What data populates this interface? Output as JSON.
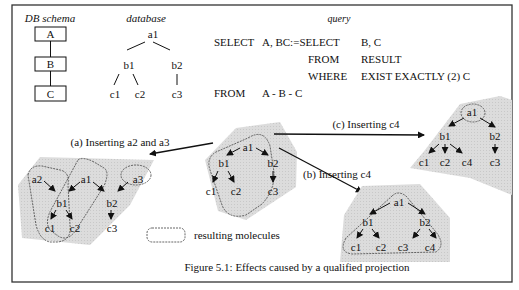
{
  "figure": {
    "caption": "Figure 5.1: Effects caused by a qualified projection",
    "colors": {
      "shade": "#d9d9d9",
      "ink": "#111111",
      "border": "#333333"
    }
  },
  "schema": {
    "title": "DB schema",
    "boxes": [
      "A",
      "B",
      "C"
    ]
  },
  "database": {
    "title": "database",
    "nodes": {
      "a1": "a1",
      "b1": "b1",
      "b2": "b2",
      "c1": "c1",
      "c2": "c2",
      "c3": "c3"
    }
  },
  "query": {
    "title": "query",
    "lines": [
      {
        "kw": "SELECT",
        "arg": "A, BC:=SELECT",
        "arg2": "B, C"
      },
      {
        "kw": "FROM",
        "arg": "RESULT"
      },
      {
        "kw": "WHERE",
        "arg": "EXIST EXACTLY (2) C"
      },
      {
        "kw": "FROM",
        "arg": "A - B - C"
      }
    ]
  },
  "center_graph": {
    "nodes": {
      "a1": "a1",
      "b1": "b1",
      "b2": "b2",
      "c1": "c1",
      "c2": "c2",
      "c3": "c3"
    }
  },
  "case_a": {
    "label": "(a) Inserting a2 and a3",
    "nodes": {
      "a1": "a1",
      "a2": "a2",
      "a3": "a3",
      "b1": "b1",
      "b2": "b2",
      "c1": "c1",
      "c2": "c2",
      "c3": "c3"
    }
  },
  "case_b": {
    "label": "(b) Inserting c4",
    "nodes": {
      "a1": "a1",
      "b1": "b1",
      "b2": "b2",
      "c1": "c1",
      "c2": "c2",
      "c3": "c3",
      "c4": "c4"
    }
  },
  "case_c": {
    "label": "(c) Inserting c4",
    "nodes": {
      "a1": "a1",
      "b1": "b1",
      "b2": "b2",
      "c1": "c1",
      "c2": "c2",
      "c4": "c4",
      "c3": "c3"
    }
  },
  "legend": {
    "label": "resulting  molecules"
  }
}
